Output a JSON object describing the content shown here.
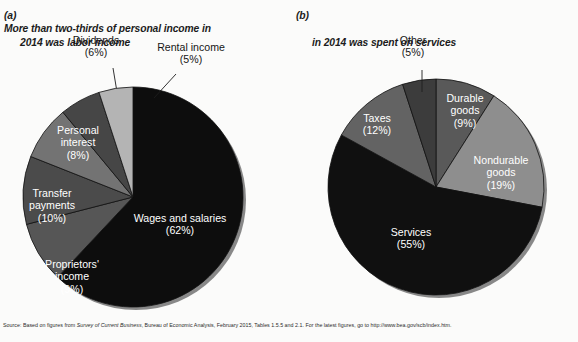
{
  "figure": {
    "background_color": "#fbfbfa",
    "source_note": {
      "prefix": "Source: Based on figures from ",
      "italic_title": "Survey of Current Business",
      "suffix": ", Bureau of Economic Analysis, February 2015, Tables 1.5.5 and 2.1. For the latest figures, go to http://www.bea.gov/scb/index.htm."
    }
  },
  "panel_a": {
    "label": "(a)",
    "title_line1": "More than two-thirds of personal income in",
    "title_line2": "2014 was labor income"
  },
  "panel_b": {
    "label": "(b)",
    "title_line1": "",
    "title_line2": "in 2014 was spent on services"
  },
  "chart_data": [
    {
      "type": "pie",
      "id": "personal-income",
      "title": "(a) More than two-thirds of personal income in 2014 was labor income",
      "center": [
        133,
        197
      ],
      "radius": 110,
      "start_angle_deg": 0,
      "direction": "clockwise",
      "legend": "inside-slice-and-callout",
      "categories": [
        "Wages and salaries",
        "Proprietors' income",
        "Transfer payments",
        "Personal interest",
        "Dividends",
        "Rental income"
      ],
      "values": [
        62,
        9,
        10,
        8,
        6,
        5
      ],
      "unit": "percent",
      "slices": [
        {
          "name": "Wages and salaries",
          "value": 62,
          "label": "Wages and salaries\n(62%)",
          "color": "#0d0d0d",
          "label_placement": "inside",
          "label_color": "#ffffff",
          "label_xy": [
            180,
            222
          ]
        },
        {
          "name": "Proprietors' income",
          "value": 9,
          "label": "Proprietors'\nincome\n(9%)",
          "color": "#565656",
          "label_placement": "inside",
          "label_color": "#ffffff",
          "label_xy": [
            72,
            268
          ]
        },
        {
          "name": "Transfer payments",
          "value": 10,
          "label": "Transfer\npayments\n(10%)",
          "color": "#4b4b4b",
          "label_placement": "inside",
          "label_color": "#ffffff",
          "label_xy": [
            52,
            197
          ]
        },
        {
          "name": "Personal interest",
          "value": 8,
          "label": "Personal\ninterest\n(8%)",
          "color": "#737373",
          "label_placement": "inside",
          "label_color": "#ffffff",
          "label_xy": [
            78,
            134
          ]
        },
        {
          "name": "Dividends",
          "value": 6,
          "label": "Dividends\n(6%)",
          "color": "#464646",
          "label_placement": "callout",
          "label_color": "#161616",
          "label_xy": [
            96,
            44
          ],
          "leader": [
            [
              113,
              68
            ],
            [
              117,
              92
            ]
          ]
        },
        {
          "name": "Rental income",
          "value": 5,
          "label": "Rental income\n(5%)",
          "color": "#b4b4b4",
          "label_placement": "callout",
          "label_color": "#161616",
          "label_xy": [
            191,
            51
          ],
          "leader": [
            [
              176,
              74
            ],
            [
              154,
              98
            ]
          ]
        }
      ]
    },
    {
      "type": "pie",
      "id": "personal-consumption",
      "title": "(b) ... in 2014 was spent on services",
      "center": [
        147,
        187
      ],
      "radius": 108,
      "start_angle_deg": 0,
      "direction": "clockwise",
      "legend": "inside-slice-and-callout",
      "categories": [
        "Durable goods",
        "Nondurable goods",
        "Services",
        "Taxes",
        "Other"
      ],
      "values": [
        9,
        19,
        55,
        12,
        5
      ],
      "unit": "percent",
      "slices": [
        {
          "name": "Durable goods",
          "value": 9,
          "label": "Durable\ngoods\n(9%)",
          "color": "#595959",
          "label_placement": "inside",
          "label_color": "#ffffff",
          "label_xy": [
            176,
            102
          ]
        },
        {
          "name": "Nondurable goods",
          "value": 19,
          "label": "Nondurable\ngoods\n(19%)",
          "color": "#8e8e8e",
          "label_placement": "inside",
          "label_color": "#ffffff",
          "label_xy": [
            212,
            164
          ]
        },
        {
          "name": "Services",
          "value": 55,
          "label": "Services\n(55%)",
          "color": "#101010",
          "label_placement": "inside",
          "label_color": "#ffffff",
          "label_xy": [
            122,
            236
          ]
        },
        {
          "name": "Taxes",
          "value": 12,
          "label": "Taxes\n(12%)",
          "color": "#636363",
          "label_placement": "inside",
          "label_color": "#ffffff",
          "label_xy": [
            88,
            122
          ]
        },
        {
          "name": "Other",
          "value": 5,
          "label": "Other\n(5%)",
          "color": "#3c3c3c",
          "label_placement": "callout",
          "label_color": "#161616",
          "label_xy": [
            124,
            44
          ],
          "leader": [
            [
              133,
              70
            ],
            [
              133,
              92
            ]
          ]
        }
      ]
    }
  ]
}
